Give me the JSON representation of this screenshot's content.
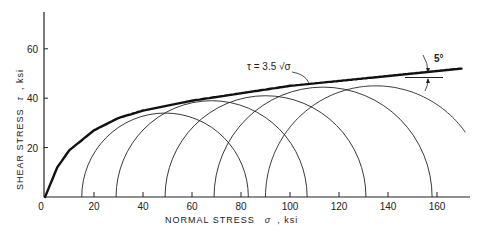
{
  "chart_data": {
    "type": "line",
    "title": "",
    "xlabel": "NORMAL STRESS  σ , ksi",
    "ylabel": "SHEAR STRESS  τ , ksi",
    "xlim": [
      0,
      175
    ],
    "ylim": [
      0,
      75
    ],
    "x_ticks": [
      "0",
      "20",
      "40",
      "60",
      "80",
      "100",
      "120",
      "140",
      "160"
    ],
    "y_ticks": [
      "20",
      "40",
      "60"
    ],
    "grid": false,
    "envelope": {
      "label": "τ = 3.5 √σ",
      "x": [
        0,
        5,
        10,
        20,
        30,
        40,
        60,
        80,
        100,
        120,
        140,
        170
      ],
      "y": [
        0,
        12,
        19,
        27,
        32,
        35,
        39,
        42,
        45,
        47,
        49,
        52
      ]
    },
    "mohr_circles": [
      {
        "sigma3": 15,
        "sigma1": 83,
        "center": 49,
        "radius": 34
      },
      {
        "sigma3": 29,
        "sigma1": 107,
        "center": 68,
        "radius": 39
      },
      {
        "sigma3": 49,
        "sigma1": 131,
        "center": 90,
        "radius": 41
      },
      {
        "sigma3": 69,
        "sigma1": 158,
        "center": 113.5,
        "radius": 44.5
      },
      {
        "sigma3": 90,
        "sigma1": 180,
        "center": 135,
        "radius": 45
      }
    ],
    "annotations": [
      "τ = 3.5 √σ",
      "5°"
    ]
  },
  "labels": {
    "xlabel": "NORMAL STRESS",
    "xsym": "σ",
    "xunit": ", ksi",
    "ylabel": "SHEAR STRESS",
    "ysym": "τ",
    "yunit": ", ksi",
    "envelope_label": "τ = 3.5 √σ",
    "angle_label": "5°"
  }
}
